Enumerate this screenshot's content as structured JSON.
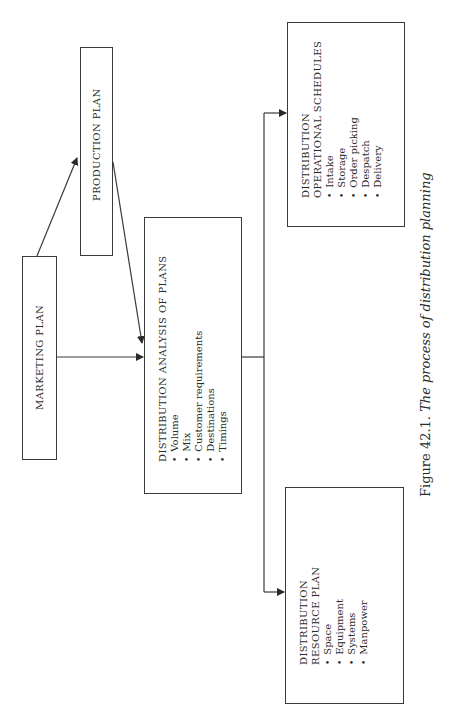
{
  "diagram": {
    "nodes": {
      "marketing": {
        "label": "MARKETING PLAN"
      },
      "production": {
        "label": "PRODUCTION PLAN"
      },
      "analysis": {
        "title": "DISTRIBUTION ANALYSIS OF PLANS",
        "items": [
          "Volume",
          "Mix",
          "Customer requirements",
          "Destinations",
          "Timings"
        ]
      },
      "operational": {
        "title_line1": "DISTRIBUTION",
        "title_line2": "OPERATIONAL SCHEDULES",
        "items": [
          "Intake",
          "Storage",
          "Order picking",
          "Despatch",
          "Delivery"
        ]
      },
      "resource": {
        "title_line1": "DISTRIBUTION",
        "title_line2": "RESOURCE PLAN",
        "items": [
          "Space",
          "Equipment",
          "Systems",
          "Manpower"
        ]
      }
    },
    "edges": [
      {
        "from": "marketing",
        "to": "production"
      },
      {
        "from": "marketing",
        "to": "analysis"
      },
      {
        "from": "production",
        "to": "analysis"
      },
      {
        "from": "analysis",
        "to": "operational"
      },
      {
        "from": "analysis",
        "to": "resource"
      }
    ]
  },
  "caption": {
    "figure": "Figure 42.1.",
    "text": "The process of distribution planning"
  },
  "colors": {
    "line": "#3a3a3a",
    "background": "#ffffff"
  }
}
